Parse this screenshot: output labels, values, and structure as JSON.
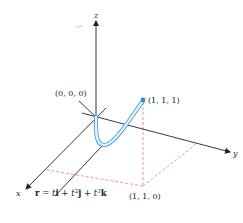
{
  "diagram": {
    "type": "3d-space-curve",
    "axes": {
      "x_label": "x",
      "y_label": "y",
      "z_label": "z"
    },
    "points": {
      "origin_label": "(0, 0, 0)",
      "endpoint_label": "(1, 1, 1)",
      "projection_label": "(1, 1, 0)"
    },
    "equation": {
      "r": "r",
      "eq": " = ",
      "t1": "t",
      "i": "i",
      "plus1": " + ",
      "t2": "t",
      "exp2": "2",
      "j": "j",
      "plus2": " + ",
      "t3": "t",
      "exp3": "3",
      "k": "k"
    },
    "colors": {
      "axis": "#222222",
      "curve": "#7fc4e8",
      "curve_outline": "#3a9bd4",
      "point": "#2a8fd0",
      "dashed": "#e8806a"
    }
  }
}
